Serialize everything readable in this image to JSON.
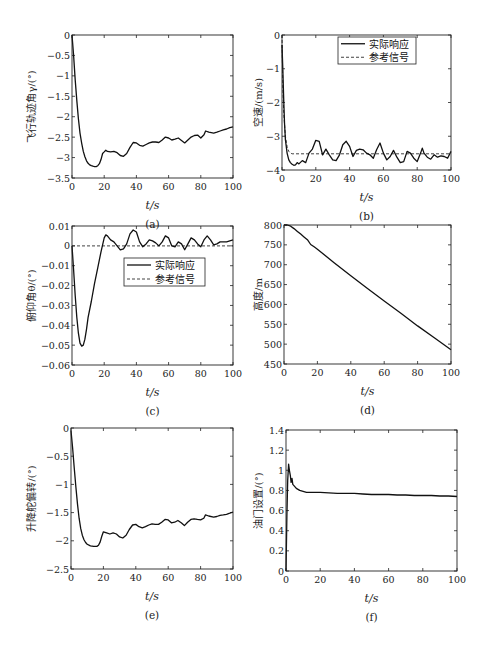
{
  "chart_data": [
    {
      "id": "a",
      "type": "line",
      "caption": "(a)",
      "xlabel": "t/s",
      "ylabel": "飞行轨迹角γ/(°)",
      "box": [
        72,
        35,
        233,
        178
      ],
      "xlim": [
        0,
        100
      ],
      "ylim": [
        -3.5,
        0
      ],
      "xticks": [
        0,
        20,
        40,
        60,
        80,
        100
      ],
      "yticks": [
        0,
        -0.5,
        -1,
        -1.5,
        -2,
        -2.5,
        -3,
        -3.5
      ],
      "ytick_labels": [
        "0",
        "−0.5",
        "−1",
        "−1.5",
        "−2",
        "−2.5",
        "−3",
        "−3.5"
      ],
      "series": [
        {
          "name": "实际响应",
          "style": "solid",
          "x": [
            0,
            1,
            2,
            3,
            4,
            5,
            6,
            7,
            8,
            9,
            10,
            11,
            12,
            13,
            14,
            15,
            16,
            17,
            18,
            19,
            20,
            21,
            22,
            24,
            26,
            28,
            30,
            32,
            34,
            36,
            38,
            40,
            42,
            44,
            46,
            48,
            50,
            52,
            54,
            56,
            58,
            60,
            62,
            64,
            66,
            68,
            70,
            72,
            74,
            76,
            78,
            80,
            82,
            83,
            85,
            88,
            90,
            92,
            94,
            96,
            98,
            100
          ],
          "y": [
            0,
            -0.5,
            -1.1,
            -1.6,
            -2.05,
            -2.4,
            -2.65,
            -2.85,
            -2.98,
            -3.08,
            -3.14,
            -3.18,
            -3.2,
            -3.21,
            -3.22,
            -3.22,
            -3.2,
            -3.15,
            -3.05,
            -2.9,
            -2.86,
            -2.82,
            -2.85,
            -2.86,
            -2.85,
            -2.88,
            -2.95,
            -2.97,
            -2.9,
            -2.75,
            -2.63,
            -2.64,
            -2.7,
            -2.72,
            -2.68,
            -2.64,
            -2.62,
            -2.62,
            -2.63,
            -2.57,
            -2.5,
            -2.52,
            -2.57,
            -2.55,
            -2.52,
            -2.58,
            -2.64,
            -2.57,
            -2.5,
            -2.46,
            -2.45,
            -2.52,
            -2.44,
            -2.35,
            -2.38,
            -2.4,
            -2.38,
            -2.35,
            -2.32,
            -2.3,
            -2.27,
            -2.25
          ]
        }
      ]
    },
    {
      "id": "b",
      "type": "line",
      "caption": "(b)",
      "xlabel": "t/s",
      "ylabel": "空速/(m/s)",
      "box": [
        282,
        35,
        451,
        170
      ],
      "xlim": [
        0,
        100
      ],
      "ylim": [
        -4,
        0
      ],
      "xticks": [
        0,
        20,
        40,
        60,
        80,
        100
      ],
      "yticks": [
        0,
        -1,
        -2,
        -3,
        -4
      ],
      "ytick_labels": [
        "0",
        "−1",
        "−2",
        "−3",
        "−4"
      ],
      "legend": {
        "box": [
          338,
          37,
          416,
          64
        ],
        "entries": [
          "实际响应",
          "参考信号"
        ]
      },
      "series": [
        {
          "name": "实际响应",
          "style": "solid",
          "x": [
            0,
            0.5,
            1,
            1.5,
            2,
            3,
            4,
            5,
            6,
            7,
            8,
            9,
            10,
            12,
            14,
            16,
            18,
            20,
            22,
            24,
            26,
            28,
            30,
            32,
            34,
            36,
            38,
            40,
            42,
            44,
            46,
            48,
            50,
            52,
            54,
            56,
            58,
            60,
            62,
            64,
            66,
            68,
            70,
            72,
            74,
            76,
            78,
            80,
            82,
            83,
            84,
            86,
            88,
            90,
            92,
            94,
            96,
            98,
            100
          ],
          "y": [
            -0.3,
            -1.0,
            -1.9,
            -2.6,
            -3.1,
            -3.5,
            -3.7,
            -3.78,
            -3.83,
            -3.86,
            -3.85,
            -3.78,
            -3.82,
            -3.72,
            -3.78,
            -3.5,
            -3.38,
            -3.12,
            -3.15,
            -3.55,
            -3.38,
            -3.55,
            -3.7,
            -3.72,
            -3.55,
            -3.25,
            -3.15,
            -3.3,
            -3.6,
            -3.42,
            -3.38,
            -3.4,
            -3.5,
            -3.55,
            -3.65,
            -3.4,
            -3.2,
            -3.5,
            -3.7,
            -3.6,
            -3.42,
            -3.62,
            -3.78,
            -3.75,
            -3.45,
            -3.5,
            -3.65,
            -3.75,
            -3.5,
            -3.35,
            -3.5,
            -3.62,
            -3.68,
            -3.55,
            -3.62,
            -3.58,
            -3.6,
            -3.65,
            -3.45
          ]
        },
        {
          "name": "参考信号",
          "style": "dashed",
          "x": [
            0,
            0.5,
            1,
            2,
            3,
            4,
            5,
            6,
            8,
            100
          ],
          "y": [
            0,
            -1.5,
            -2.3,
            -3.0,
            -3.3,
            -3.45,
            -3.5,
            -3.52,
            -3.52,
            -3.52
          ]
        }
      ]
    },
    {
      "id": "c",
      "type": "line",
      "caption": "(c)",
      "xlabel": "t/s",
      "ylabel": "俯仰角θ/(°)",
      "box": [
        72,
        226,
        233,
        365
      ],
      "xlim": [
        0,
        100
      ],
      "ylim": [
        -0.06,
        0.01
      ],
      "xticks": [
        0,
        20,
        40,
        60,
        80,
        100
      ],
      "yticks": [
        0.01,
        0,
        -0.01,
        -0.02,
        -0.03,
        -0.04,
        -0.05,
        -0.06
      ],
      "ytick_labels": [
        "0.01",
        "0",
        "−0.01",
        "−0.02",
        "−0.03",
        "−0.04",
        "−0.05",
        "−0.06"
      ],
      "legend": {
        "box": [
          124,
          258,
          205,
          286
        ],
        "entries": [
          "实际响应",
          "参考信号"
        ]
      },
      "series": [
        {
          "name": "实际响应",
          "style": "solid",
          "x": [
            0,
            1,
            2,
            3,
            4,
            5,
            6,
            7,
            8,
            9,
            10,
            12,
            14,
            16,
            18,
            20,
            21,
            22,
            24,
            26,
            28,
            30,
            32,
            34,
            36,
            38,
            40,
            42,
            44,
            46,
            48,
            50,
            52,
            54,
            56,
            58,
            60,
            62,
            64,
            66,
            68,
            70,
            72,
            74,
            76,
            78,
            80,
            82,
            84,
            86,
            88,
            90,
            92,
            94,
            96,
            98,
            100
          ],
          "y": [
            0,
            -0.012,
            -0.025,
            -0.036,
            -0.044,
            -0.049,
            -0.0505,
            -0.05,
            -0.047,
            -0.042,
            -0.036,
            -0.028,
            -0.019,
            -0.011,
            -0.003,
            0.004,
            0.0055,
            0.005,
            0.003,
            0.002,
            0,
            -0.002,
            -0.0015,
            0.001,
            0.006,
            0.008,
            0.007,
            0.002,
            -0.0005,
            0.001,
            0.003,
            0.0025,
            0.0015,
            0,
            0.002,
            0.005,
            0.004,
            0,
            -0.0005,
            0.002,
            0.001,
            -0.002,
            0.001,
            0.004,
            0.003,
            0.001,
            -0.0005,
            0.003,
            0.005,
            0.003,
            0.0005,
            0.001,
            0.002,
            0.002,
            0.002,
            0.0025,
            0.003
          ]
        },
        {
          "name": "参考信号",
          "style": "dashed",
          "x": [
            0,
            100
          ],
          "y": [
            0,
            0
          ]
        }
      ]
    },
    {
      "id": "d",
      "type": "line",
      "caption": "(d)",
      "xlabel": "t/s",
      "ylabel": "高度/m",
      "box": [
        284,
        225,
        451,
        364
      ],
      "xlim": [
        0,
        100
      ],
      "ylim": [
        450,
        800
      ],
      "xticks": [
        0,
        20,
        40,
        60,
        80,
        100
      ],
      "yticks": [
        800,
        750,
        700,
        650,
        600,
        550,
        500,
        450
      ],
      "ytick_labels": [
        "800",
        "750",
        "700",
        "650",
        "600",
        "550",
        "500",
        "450"
      ],
      "series": [
        {
          "name": "高度",
          "style": "solid",
          "x": [
            0,
            2,
            4,
            6,
            8,
            10,
            12,
            14,
            16,
            18,
            20,
            30,
            40,
            50,
            60,
            70,
            80,
            90,
            100
          ],
          "y": [
            800,
            800,
            797,
            791,
            784,
            777,
            770,
            763,
            751,
            745,
            739,
            705,
            672,
            640,
            609,
            578,
            546,
            516,
            486
          ]
        }
      ]
    },
    {
      "id": "e",
      "type": "line",
      "caption": "(e)",
      "xlabel": "t/s",
      "ylabel": "升降舵偏转/(°)",
      "box": [
        71,
        428,
        233,
        569
      ],
      "xlim": [
        0,
        100
      ],
      "ylim": [
        -2.5,
        0
      ],
      "xticks": [
        0,
        20,
        40,
        60,
        80,
        100
      ],
      "yticks": [
        0,
        -0.5,
        -1,
        -1.5,
        -2,
        -2.5
      ],
      "ytick_labels": [
        "0",
        "−0.5",
        "−1",
        "−1.5",
        "−2",
        "−2.5"
      ],
      "series": [
        {
          "name": "升降舵偏转",
          "style": "solid",
          "x": [
            0,
            1,
            2,
            3,
            4,
            5,
            6,
            7,
            8,
            9,
            10,
            12,
            14,
            16,
            17,
            18,
            19,
            20,
            22,
            24,
            26,
            28,
            30,
            32,
            34,
            36,
            38,
            40,
            42,
            44,
            46,
            48,
            50,
            52,
            54,
            56,
            58,
            60,
            62,
            64,
            66,
            68,
            70,
            72,
            74,
            76,
            78,
            80,
            82,
            83,
            85,
            88,
            90,
            92,
            94,
            96,
            98,
            100
          ],
          "y": [
            -0.05,
            -0.35,
            -0.7,
            -1.05,
            -1.35,
            -1.6,
            -1.78,
            -1.9,
            -1.98,
            -2.03,
            -2.06,
            -2.09,
            -2.1,
            -2.1,
            -2.08,
            -2.02,
            -1.92,
            -1.84,
            -1.86,
            -1.88,
            -1.86,
            -1.88,
            -1.93,
            -1.95,
            -1.9,
            -1.8,
            -1.72,
            -1.71,
            -1.75,
            -1.77,
            -1.75,
            -1.72,
            -1.7,
            -1.71,
            -1.71,
            -1.67,
            -1.62,
            -1.63,
            -1.68,
            -1.67,
            -1.64,
            -1.68,
            -1.73,
            -1.67,
            -1.62,
            -1.61,
            -1.62,
            -1.63,
            -1.6,
            -1.54,
            -1.56,
            -1.58,
            -1.57,
            -1.55,
            -1.54,
            -1.53,
            -1.51,
            -1.49
          ]
        }
      ]
    },
    {
      "id": "f",
      "type": "line",
      "caption": "(f)",
      "xlabel": "t/s",
      "ylabel": "油门设置/(°)",
      "box": [
        286,
        430,
        457,
        571
      ],
      "xlim": [
        0,
        100
      ],
      "ylim": [
        0,
        1.4
      ],
      "xticks": [
        0,
        20,
        40,
        60,
        80,
        100
      ],
      "yticks": [
        1.4,
        1.2,
        1,
        0.8,
        0.6,
        0.4,
        0.2,
        0
      ],
      "ytick_labels": [
        "1.4",
        "1.2",
        "1",
        "0.8",
        "0.6",
        "0.4",
        "0.2",
        "0"
      ],
      "series": [
        {
          "name": "油门设置",
          "style": "solid",
          "x": [
            0,
            0.5,
            1,
            1.5,
            2,
            2.5,
            3,
            3.5,
            4,
            5,
            6,
            7,
            8,
            10,
            12,
            15,
            20,
            25,
            30,
            35,
            40,
            45,
            50,
            55,
            60,
            65,
            70,
            75,
            80,
            85,
            90,
            95,
            100
          ],
          "y": [
            0,
            0.55,
            0.9,
            1.06,
            1.0,
            0.95,
            0.88,
            0.92,
            0.86,
            0.84,
            0.82,
            0.81,
            0.8,
            0.79,
            0.78,
            0.78,
            0.78,
            0.775,
            0.77,
            0.77,
            0.77,
            0.765,
            0.76,
            0.76,
            0.76,
            0.755,
            0.755,
            0.75,
            0.75,
            0.75,
            0.745,
            0.745,
            0.74
          ]
        }
      ]
    }
  ]
}
